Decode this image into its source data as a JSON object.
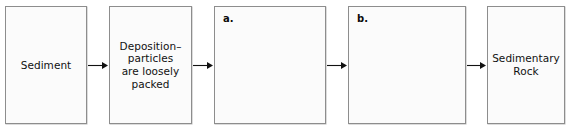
{
  "diagram": {
    "orientation": "horizontal",
    "background_color": "#ffffff",
    "box_fill_color": "#fbfbfb",
    "box_border_color": "#8d8d8d",
    "text_color": "#111111",
    "arrow_color": "#111111",
    "boxes": [
      {
        "id": "sediment",
        "label": "",
        "text": "Sediment",
        "empty": false,
        "x": 5,
        "y": 6,
        "w": 82,
        "h": 118
      },
      {
        "id": "deposition",
        "label": "",
        "text": "Deposition–\nparticles\nare loosely\npacked",
        "empty": false,
        "x": 109,
        "y": 6,
        "w": 83,
        "h": 118
      },
      {
        "id": "blank-a",
        "label": "a.",
        "text": "",
        "empty": true,
        "x": 214,
        "y": 6,
        "w": 112,
        "h": 118
      },
      {
        "id": "blank-b",
        "label": "b.",
        "text": "",
        "empty": true,
        "x": 348,
        "y": 6,
        "w": 118,
        "h": 118
      },
      {
        "id": "sedimentary-rock",
        "label": "",
        "text": "Sedimentary\nRock",
        "empty": false,
        "x": 487,
        "y": 6,
        "w": 78,
        "h": 118
      }
    ],
    "arrows": [
      {
        "id": "arrow-1",
        "from": "sediment",
        "to": "deposition",
        "x": 88,
        "y": 60,
        "w": 20
      },
      {
        "id": "arrow-2",
        "from": "deposition",
        "to": "blank-a",
        "x": 193,
        "y": 60,
        "w": 20
      },
      {
        "id": "arrow-3",
        "from": "blank-a",
        "to": "blank-b",
        "x": 327,
        "y": 60,
        "w": 20
      },
      {
        "id": "arrow-4",
        "from": "blank-b",
        "to": "sedimentary-rock",
        "x": 467,
        "y": 60,
        "w": 19
      }
    ]
  }
}
